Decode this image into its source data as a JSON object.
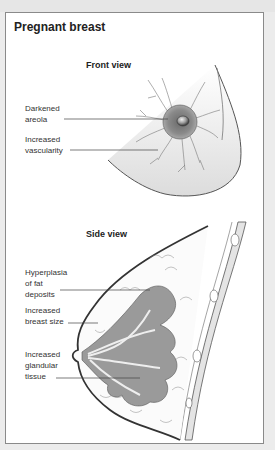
{
  "figure": {
    "title": "Pregnant breast",
    "front_view": {
      "heading": "Front view",
      "labels": [
        {
          "text": "Darkened\nareola",
          "target": "areola"
        },
        {
          "text": "Increased\nvascularity",
          "target": "veins"
        }
      ]
    },
    "side_view": {
      "heading": "Side view",
      "labels": [
        {
          "text": "Hyperplasia\nof fat\ndeposits",
          "target": "fat-deposits"
        },
        {
          "text": "Increased\nbreast size",
          "target": "breast-outline"
        },
        {
          "text": "Increased\nglandular\ntissue",
          "target": "glandular-tissue"
        }
      ]
    }
  }
}
